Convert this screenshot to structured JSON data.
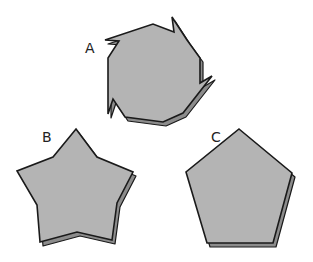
{
  "diagram": {
    "colors": {
      "face": "#b4b4b4",
      "side": "#8c8c8c",
      "outline": "#1a1a1a",
      "label": "#222222"
    },
    "shapes": [
      {
        "label": "A",
        "kind": "octagon-with-flags",
        "label_pos": [
          85,
          53
        ],
        "points": "105,40 153,24 174,32 172,17 187,40 200,58 200,83 212,76 183,113 163,122 125,117 113,99 108,114 108,58 119,41"
      },
      {
        "label": "B",
        "kind": "star",
        "label_pos": [
          42,
          142
        ],
        "points": "76,129 97,157 133,172 117,203 112,240 77,232 40,242 37,205 17,171 53,157"
      },
      {
        "label": "C",
        "kind": "pentagon",
        "label_pos": [
          211,
          142
        ],
        "points": "239,129 292,173 273,243 207,243 186,172"
      }
    ]
  }
}
